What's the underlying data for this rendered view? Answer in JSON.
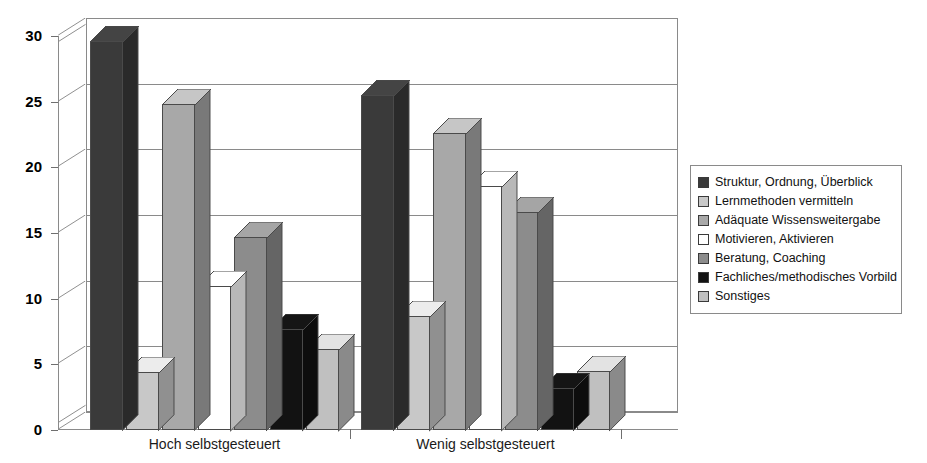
{
  "chart_data": {
    "type": "bar",
    "title": "",
    "subtitle": "",
    "xlabel": "",
    "ylabel": "",
    "categories": [
      "Hoch selbstgesteuert",
      "Wenig selbstgesteuert"
    ],
    "ylim": [
      0,
      30
    ],
    "yticks": [
      0,
      5,
      10,
      15,
      20,
      25,
      30
    ],
    "ytick_labels": [
      "0",
      "5",
      "10",
      "15",
      "20",
      "25",
      "30"
    ],
    "grid": true,
    "legend_position": "right",
    "style": "3d-clustered-column",
    "series": [
      {
        "name": "Struktur, Ordnung, Überblick",
        "color": "#3a3a3a",
        "values": [
          29.6,
          25.5
        ]
      },
      {
        "name": "Lernmethoden vermitteln",
        "color": "#c8c8c8",
        "values": [
          4.4,
          8.7
        ]
      },
      {
        "name": "Adäquate Wissensweitergabe",
        "color": "#a8a8a8",
        "values": [
          24.8,
          22.6
        ]
      },
      {
        "name": "Motivieren, Aktivieren",
        "color": "#ffffff",
        "values": [
          11.0,
          18.6
        ]
      },
      {
        "name": "Beratung, Coaching",
        "color": "#8c8c8c",
        "values": [
          14.7,
          16.6
        ]
      },
      {
        "name": "Fachliches/methodisches Vorbild",
        "color": "#121212",
        "values": [
          7.7,
          3.2
        ]
      },
      {
        "name": "Sonstiges",
        "color": "#c0c0c0",
        "values": [
          6.2,
          4.5
        ]
      }
    ]
  },
  "legend": {
    "items": [
      {
        "label": "Struktur, Ordnung, Überblick",
        "color": "#3a3a3a"
      },
      {
        "label": "Lernmethoden vermitteln",
        "color": "#c8c8c8"
      },
      {
        "label": "Adäquate Wissensweitergabe",
        "color": "#a8a8a8"
      },
      {
        "label": "Motivieren, Aktivieren",
        "color": "#ffffff"
      },
      {
        "label": "Beratung, Coaching",
        "color": "#8c8c8c"
      },
      {
        "label": "Fachliches/methodisches Vorbild",
        "color": "#121212"
      },
      {
        "label": "Sonstiges",
        "color": "#c0c0c0"
      }
    ]
  },
  "colors": {
    "axis": "#8a8a8a",
    "text": "#000000",
    "background": "#ffffff"
  }
}
